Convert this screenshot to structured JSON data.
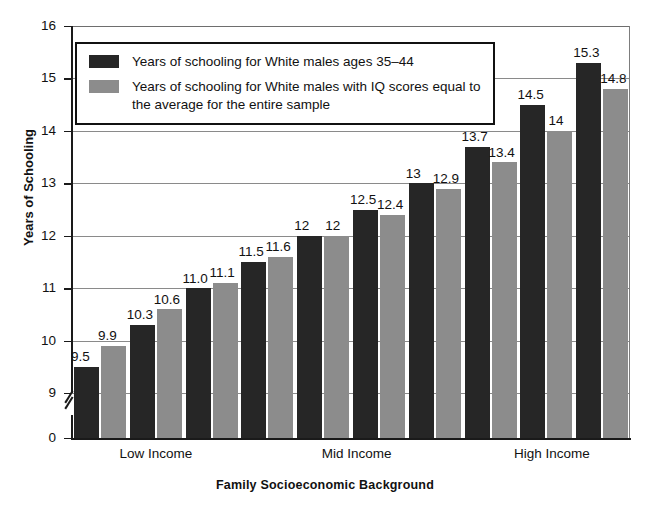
{
  "chart_data": {
    "type": "bar",
    "title": "",
    "xlabel": "Family Socioeconomic Background",
    "ylabel": "Years of Schooling",
    "ylim": [
      9,
      16
    ],
    "y_ticks": [
      "0",
      "9",
      "10",
      "11",
      "12",
      "13",
      "14",
      "15",
      "16"
    ],
    "y_axis_break": true,
    "grid": true,
    "legend_position": "upper-left-inside",
    "categories": [
      "1",
      "2",
      "3",
      "4",
      "5",
      "6",
      "7",
      "8",
      "9",
      "10"
    ],
    "group_labels": [
      "Low Income",
      "Mid Income",
      "High Income"
    ],
    "series": [
      {
        "name": "Years of schooling for White males ages 35–44",
        "color": "#262626",
        "values": [
          9.5,
          10.3,
          11.0,
          11.5,
          12,
          12.5,
          13,
          13.7,
          14.5,
          15.3
        ],
        "labels": [
          "9.5",
          "10.3",
          "11.0",
          "11.5",
          "12",
          "12.5",
          "13",
          "13.7",
          "14.5",
          "15.3"
        ]
      },
      {
        "name": "Years of schooling for White males with IQ scores equal to the average for the entire sample",
        "color": "#8c8c8c",
        "values": [
          9.9,
          10.6,
          11.1,
          11.6,
          12,
          12.4,
          12.9,
          13.4,
          14,
          14.8
        ],
        "labels": [
          "9.9",
          "10.6",
          "11.1",
          "11.6",
          "12",
          "12.4",
          "12.9",
          "13.4",
          "14",
          "14.8"
        ]
      }
    ]
  },
  "legend": {
    "entries": [
      {
        "swatch": "dark",
        "text": "Years of schooling for White males ages 35–44"
      },
      {
        "swatch": "gray",
        "text": "Years of schooling for White males with IQ scores equal to the average for the entire sample"
      }
    ]
  },
  "axes": {
    "y_title": "Years of Schooling",
    "x_title": "Family Socioeconomic Background"
  }
}
